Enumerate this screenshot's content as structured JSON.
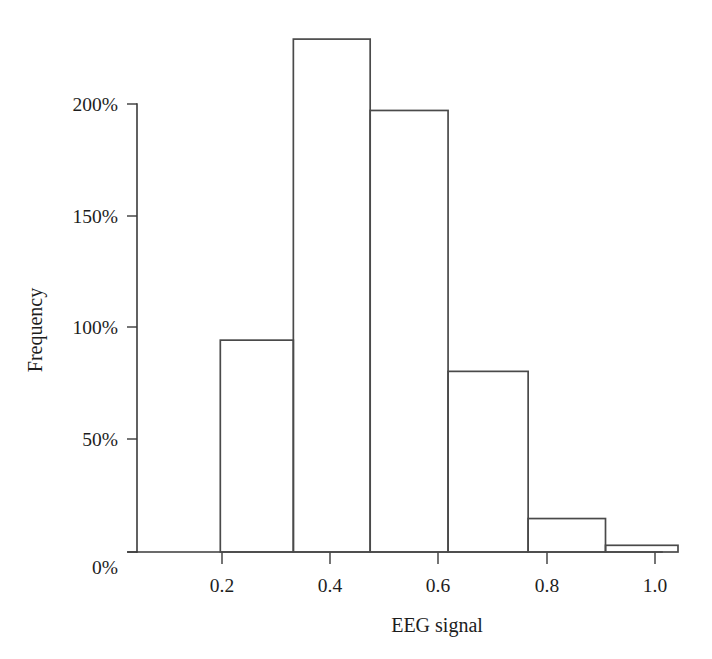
{
  "chart_data": {
    "type": "bar",
    "title": "",
    "subtitle": "",
    "xlabel": "EEG signal",
    "ylabel": "Frequency",
    "grid": false,
    "legend": null,
    "xlim": [
      0.0,
      1.05
    ],
    "ylim": [
      0,
      232
    ],
    "y_tick_labels": [
      "0%",
      "50%",
      "100%",
      "150%",
      "200%"
    ],
    "y_tick_values": [
      0,
      50,
      100,
      150,
      200
    ],
    "x_tick_labels": [
      "0.2",
      "0.4",
      "0.6",
      "0.8",
      "1.0"
    ],
    "x_tick_values": [
      0.2,
      0.4,
      0.6,
      0.8,
      1.0
    ],
    "x_minor_tick_values": [
      0.3,
      0.5,
      0.7,
      0.9
    ],
    "bin_edges": [
      0.154,
      0.289,
      0.431,
      0.575,
      0.723,
      0.866,
      1.0
    ],
    "values": [
      95,
      230,
      198,
      81,
      15,
      3
    ],
    "value_unit": "%",
    "bars": [
      {
        "left": 0.154,
        "right": 0.289,
        "value": 95
      },
      {
        "left": 0.289,
        "right": 0.431,
        "value": 230
      },
      {
        "left": 0.431,
        "right": 0.575,
        "value": 198
      },
      {
        "left": 0.575,
        "right": 0.723,
        "value": 81
      },
      {
        "left": 0.723,
        "right": 0.866,
        "value": 15
      },
      {
        "left": 0.866,
        "right": 1.0,
        "value": 3
      }
    ],
    "colors": {
      "bar_fill": "none",
      "bar_stroke": "#4a4a4a",
      "axis": "#3a3a3a",
      "text": "#1d1d1d",
      "background": "#ffffff"
    }
  }
}
